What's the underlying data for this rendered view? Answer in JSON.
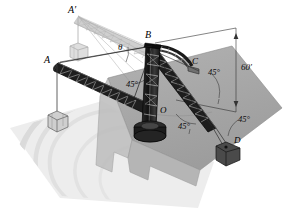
{
  "figure": {
    "kind": "engineering-diagram",
    "background_color": "#ffffff",
    "ground_color": "#a8a8a8",
    "water_color": "#ededed",
    "structure_color": "#1a1a1a",
    "ghost_color": "#b4b4b4"
  },
  "points": {
    "a_prime": "A′",
    "b": "B",
    "c": "C",
    "a": "A",
    "o": "O",
    "d": "D"
  },
  "dimensions": {
    "height": "60′",
    "angle_theta": "θ",
    "angle_mast_left": "45°",
    "angle_upper_right": "45°",
    "angle_lower_center": "45°",
    "angle_lower_right": "45°"
  },
  "elements": {
    "mast": "lattice mast",
    "boom_left": "lattice boom O to A",
    "boom_ghost": "raised boom position to A-prime",
    "boom_right": "lattice boom to D",
    "pedestal": "rotating base pedestal at O",
    "crate_a": "suspended crate at A",
    "crate_a_prime": "suspended crate at A-prime",
    "crate_d": "suspended crate at D",
    "quay": "quay deck",
    "water": "water surface with ripples"
  }
}
